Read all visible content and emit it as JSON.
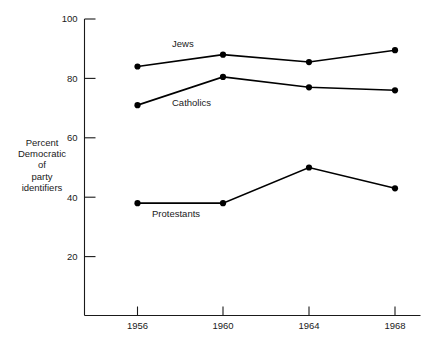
{
  "chart_data": {
    "type": "line",
    "title": "",
    "subtitle": "",
    "xlabel": "",
    "ylabel": "Percent Democratic of party identifiers",
    "ylabel_lines": [
      "Percent",
      "Democratic",
      "of",
      "party",
      "identifiers"
    ],
    "categories": [
      "1956",
      "1960",
      "1964",
      "1968"
    ],
    "x": [
      1956,
      1960,
      1964,
      1968
    ],
    "xlim": [
      1954,
      1970
    ],
    "ylim": [
      0,
      100
    ],
    "yticks": [
      20,
      40,
      60,
      80,
      100
    ],
    "ytick_labels": [
      "20",
      "40",
      "60",
      "80",
      "100"
    ],
    "xtick_labels": [
      "1956",
      "1960",
      "1964",
      "1968"
    ],
    "grid": false,
    "legend_position": "inline-annotations",
    "series": [
      {
        "name": "Jews",
        "label": "Jews",
        "values": [
          84,
          88,
          85.5,
          89.5
        ],
        "color": "#000000",
        "label_x": 1958.0,
        "label_y": 91.5
      },
      {
        "name": "Catholics",
        "label": "Catholics",
        "values": [
          71,
          80.5,
          77,
          76
        ],
        "color": "#000000",
        "label_x": 1958.0,
        "label_y": 71.5
      },
      {
        "name": "Protestants",
        "label": "Protestants",
        "values": [
          38,
          38,
          50,
          43
        ],
        "color": "#000000",
        "label_x": 1957.0,
        "label_y": 34.0
      }
    ]
  },
  "axis": {
    "y_axis_name": "percent-democratic-axis",
    "x_axis_name": "election-year-axis"
  }
}
